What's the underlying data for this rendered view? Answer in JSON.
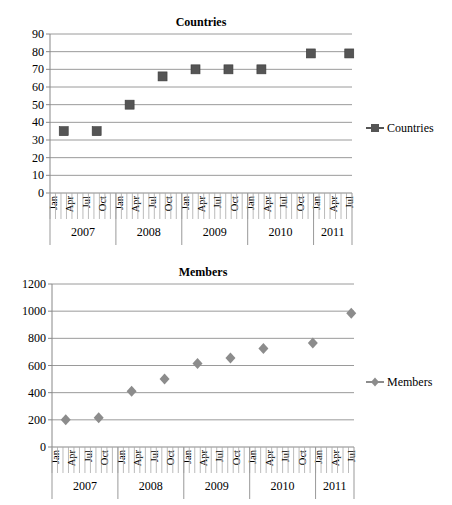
{
  "chart_data": [
    {
      "type": "scatter",
      "title": "Countries",
      "xlabel": "",
      "ylabel": "",
      "ylim": [
        0,
        90
      ],
      "ytick_step": 10,
      "yticks": [
        "0",
        "10",
        "20",
        "30",
        "40",
        "50",
        "60",
        "70",
        "80",
        "90"
      ],
      "grid": true,
      "legend_position": "right",
      "x_axis": {
        "granularity": "month",
        "start": "Jan 2007",
        "end": "Jul 2011",
        "month_labels": [
          "Jan",
          "Apr",
          "Jul",
          "Oct"
        ],
        "years": [
          {
            "label": "2007",
            "months": 12,
            "quarters": [
              "Jan",
              "Apr",
              "Jul",
              "Oct"
            ]
          },
          {
            "label": "2008",
            "months": 12,
            "quarters": [
              "Jan",
              "Apr",
              "Jul",
              "Oct"
            ]
          },
          {
            "label": "2009",
            "months": 12,
            "quarters": [
              "Jan",
              "Apr",
              "Jul",
              "Oct"
            ]
          },
          {
            "label": "2010",
            "months": 12,
            "quarters": [
              "Jan",
              "Apr",
              "Jul",
              "Oct"
            ]
          },
          {
            "label": "2011",
            "months": 7,
            "quarters": [
              "Jan",
              "Apr",
              "Jul"
            ]
          }
        ]
      },
      "series": [
        {
          "name": "Countries",
          "marker": "square",
          "color": "#555555",
          "x": [
            "Mar 2007",
            "Sep 2007",
            "Mar 2008",
            "Sep 2008",
            "Mar 2009",
            "Sep 2009",
            "Mar 2010",
            "Nov 2010",
            "Jul 2011"
          ],
          "month_index": [
            2,
            8,
            14,
            20,
            26,
            32,
            38,
            47,
            54
          ],
          "values": [
            35,
            35,
            50,
            66,
            70,
            70,
            70,
            79,
            79
          ]
        }
      ]
    },
    {
      "type": "scatter",
      "title": "Members",
      "xlabel": "",
      "ylabel": "",
      "ylim": [
        0,
        1200
      ],
      "ytick_step": 200,
      "yticks": [
        "0",
        "200",
        "400",
        "600",
        "800",
        "1000",
        "1200"
      ],
      "grid": true,
      "legend_position": "right",
      "x_axis": {
        "granularity": "month",
        "start": "Jan 2007",
        "end": "Jul 2011",
        "month_labels": [
          "Jan",
          "Apr",
          "Jul",
          "Oct"
        ],
        "years": [
          {
            "label": "2007",
            "months": 12,
            "quarters": [
              "Jan",
              "Apr",
              "Jul",
              "Oct"
            ]
          },
          {
            "label": "2008",
            "months": 12,
            "quarters": [
              "Jan",
              "Apr",
              "Jul",
              "Oct"
            ]
          },
          {
            "label": "2009",
            "months": 12,
            "quarters": [
              "Jan",
              "Apr",
              "Jul",
              "Oct"
            ]
          },
          {
            "label": "2010",
            "months": 12,
            "quarters": [
              "Jan",
              "Apr",
              "Jul",
              "Oct"
            ]
          },
          {
            "label": "2011",
            "months": 7,
            "quarters": [
              "Jan",
              "Apr",
              "Jul"
            ]
          }
        ]
      },
      "series": [
        {
          "name": "Members",
          "marker": "diamond",
          "color": "#8c8c8c",
          "x": [
            "Mar 2007",
            "Sep 2007",
            "Mar 2008",
            "Sep 2008",
            "Mar 2009",
            "Sep 2009",
            "Mar 2010",
            "Nov 2010",
            "Jul 2011"
          ],
          "month_index": [
            2,
            8,
            14,
            20,
            26,
            32,
            38,
            47,
            54
          ],
          "values": [
            200,
            215,
            410,
            500,
            615,
            655,
            725,
            765,
            985
          ]
        }
      ]
    }
  ]
}
